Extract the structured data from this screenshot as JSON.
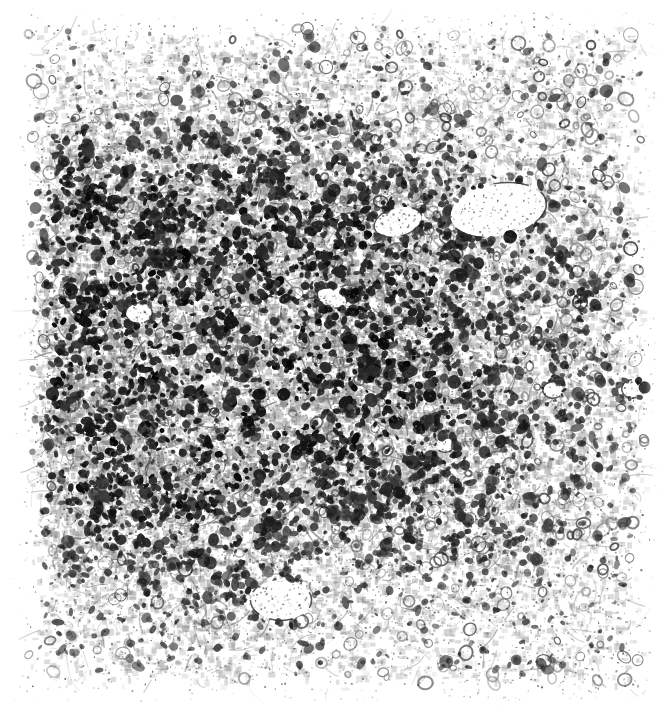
{
  "image": {
    "kind": "histology-micrograph",
    "title": "",
    "modality": "light-microscopy",
    "stain": "hematoxylin-and-eosin",
    "rendering": "grayscale-photocopy",
    "width_px": 664,
    "height_px": 710,
    "background_color": "#ffffff",
    "ink_color": "#1a1a1a",
    "midtone_color": "#8e8e8e",
    "content_bounds": {
      "left": 28,
      "top": 22,
      "right": 645,
      "bottom": 690
    },
    "margins": {
      "left": 28,
      "top": 22,
      "right": 19,
      "bottom": 20
    }
  },
  "appearance": {
    "overall_tone": "high-contrast black ink on white paper",
    "texture": "granular stippled halftone",
    "has_border": false,
    "has_scale_bar": false,
    "has_labels": false,
    "has_arrows": false
  },
  "tissue": {
    "description": "Dense mononuclear inflammatory cell infiltrate with numerous small hyperchromatic nuclei set in a pale stroma; scattered vascular lumina.",
    "nuclei_color": "#181818",
    "stroma_color": "#b9b9b9",
    "lumen_color": "#ffffff"
  },
  "chart_data": {
    "type": "heatmap",
    "xlabel": "x (px)",
    "ylabel": "y (px)",
    "xlim": [
      0,
      664
    ],
    "ylim": [
      0,
      710
    ],
    "grid": false,
    "legend": "none",
    "note": "Density field used to modulate nucleus seeding across the field of view. Values 0 (blank paper) to 1 (densest infiltrate).",
    "density_field": [
      {
        "cx": 150,
        "cy": 370,
        "radius": 250,
        "weight": 1.0,
        "label": "primary-infiltrate-focus"
      },
      {
        "cx": 300,
        "cy": 330,
        "radius": 260,
        "weight": 0.92,
        "label": "central-dense-zone"
      },
      {
        "cx": 80,
        "cy": 250,
        "radius": 170,
        "weight": 0.95,
        "label": "left-dark-band"
      },
      {
        "cx": 420,
        "cy": 430,
        "radius": 230,
        "weight": 0.62,
        "label": "right-mid-moderate"
      },
      {
        "cx": 520,
        "cy": 300,
        "radius": 200,
        "weight": 0.5,
        "label": "perivascular-zone"
      },
      {
        "cx": 250,
        "cy": 120,
        "radius": 190,
        "weight": 0.38,
        "label": "superior-sparse"
      },
      {
        "cx": 520,
        "cy": 120,
        "radius": 180,
        "weight": 0.34,
        "label": "superior-right-sparse"
      },
      {
        "cx": 200,
        "cy": 600,
        "radius": 190,
        "weight": 0.42,
        "label": "inferior-sparse"
      },
      {
        "cx": 520,
        "cy": 600,
        "radius": 200,
        "weight": 0.3,
        "label": "inferior-right-sparse"
      },
      {
        "cx": 620,
        "cy": 430,
        "radius": 150,
        "weight": 0.36,
        "label": "right-edge-sparse"
      }
    ],
    "vessels": [
      {
        "cx": 498,
        "cy": 210,
        "rx": 48,
        "ry": 26,
        "rotation": -10,
        "label": "large-vessel-lumen"
      },
      {
        "cx": 398,
        "cy": 222,
        "rx": 24,
        "ry": 14,
        "rotation": -15,
        "label": "small-vessel-lumen"
      },
      {
        "cx": 332,
        "cy": 298,
        "rx": 15,
        "ry": 9,
        "rotation": 20,
        "label": "capillary-lumen"
      },
      {
        "cx": 281,
        "cy": 600,
        "rx": 30,
        "ry": 20,
        "rotation": 0,
        "label": "inferior-clear-space"
      },
      {
        "cx": 553,
        "cy": 390,
        "rx": 10,
        "ry": 8,
        "rotation": 0,
        "label": "small-clear-space"
      },
      {
        "cx": 445,
        "cy": 445,
        "rx": 9,
        "ry": 7,
        "rotation": 0,
        "label": "small-clear-space-2"
      },
      {
        "cx": 632,
        "cy": 389,
        "rx": 10,
        "ry": 9,
        "rotation": 0,
        "label": "right-clear-space"
      },
      {
        "cx": 139,
        "cy": 313,
        "rx": 13,
        "ry": 10,
        "rotation": 0,
        "label": "left-clear-space"
      }
    ],
    "nucleus_counts_by_band": {
      "rows": [
        "y 22-160",
        "y 160-300",
        "y 300-440",
        "y 440-570",
        "y 570-690"
      ],
      "columns": [
        "x 28-180",
        "x 180-330",
        "x 330-490",
        "x 490-645"
      ],
      "values": [
        [
          90,
          110,
          95,
          70
        ],
        [
          230,
          300,
          215,
          150
        ],
        [
          330,
          345,
          250,
          175
        ],
        [
          250,
          245,
          205,
          150
        ],
        [
          130,
          140,
          125,
          95
        ]
      ]
    }
  },
  "metrics": {
    "estimated_nucleus_count": 3900,
    "estimated_stroma_fraction": 0.46,
    "estimated_lumen_fraction": 0.03
  }
}
